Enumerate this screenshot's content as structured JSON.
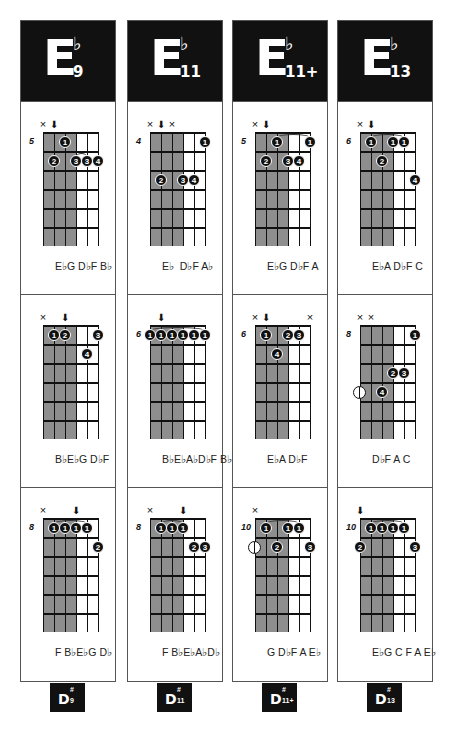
{
  "columns": [
    {
      "root": "E",
      "accidental": "♭",
      "quality": "9",
      "footer": {
        "root": "D",
        "accidental": "#",
        "quality": "9"
      },
      "x": 20,
      "diagrams": [
        {
          "start_fret": "5",
          "marks": [
            {
              "string": 0,
              "type": "x"
            },
            {
              "string": 1,
              "type": "arrow"
            }
          ],
          "dots": [
            {
              "string": 2,
              "fret": 1,
              "finger": "1"
            },
            {
              "string": 1,
              "fret": 2,
              "finger": "2"
            },
            {
              "string": 3,
              "fret": 2,
              "finger": "3"
            },
            {
              "string": 4,
              "fret": 2,
              "finger": "3"
            },
            {
              "string": 5,
              "fret": 2,
              "finger": "4"
            }
          ],
          "opens": [],
          "barres": [
            {
              "from": 3,
              "to": 4,
              "fret": 2
            }
          ],
          "notes": "E♭G D♭F B♭"
        },
        {
          "start_fret": "",
          "marks": [
            {
              "string": 0,
              "type": "x"
            },
            {
              "string": 2,
              "type": "arrow"
            }
          ],
          "dots": [
            {
              "string": 1,
              "fret": 1,
              "finger": "1"
            },
            {
              "string": 2,
              "fret": 1,
              "finger": "2"
            },
            {
              "string": 5,
              "fret": 1,
              "finger": "3"
            },
            {
              "string": 4,
              "fret": 2,
              "finger": "4"
            }
          ],
          "opens": [],
          "barres": [],
          "notes": "B♭E♭G D♭F"
        },
        {
          "start_fret": "8",
          "marks": [
            {
              "string": 0,
              "type": "x"
            },
            {
              "string": 3,
              "type": "arrow"
            }
          ],
          "dots": [
            {
              "string": 1,
              "fret": 1,
              "finger": "1"
            },
            {
              "string": 2,
              "fret": 1,
              "finger": "1"
            },
            {
              "string": 3,
              "fret": 1,
              "finger": "1"
            },
            {
              "string": 4,
              "fret": 1,
              "finger": "1"
            },
            {
              "string": 5,
              "fret": 2,
              "finger": "2"
            }
          ],
          "opens": [],
          "barres": [
            {
              "from": 1,
              "to": 4,
              "fret": 1
            }
          ],
          "notes": "F B♭E♭G D♭"
        }
      ]
    },
    {
      "root": "E",
      "accidental": "♭",
      "quality": "11",
      "footer": {
        "root": "D",
        "accidental": "#",
        "quality": "11"
      },
      "x": 127,
      "diagrams": [
        {
          "start_fret": "4",
          "marks": [
            {
              "string": 0,
              "type": "x"
            },
            {
              "string": 1,
              "type": "arrow"
            },
            {
              "string": 2,
              "type": "x"
            }
          ],
          "dots": [
            {
              "string": 5,
              "fret": 1,
              "finger": "1"
            },
            {
              "string": 1,
              "fret": 3,
              "finger": "2"
            },
            {
              "string": 3,
              "fret": 3,
              "finger": "3"
            },
            {
              "string": 4,
              "fret": 3,
              "finger": "4"
            }
          ],
          "opens": [],
          "barres": [],
          "notes": "E♭  D♭F A♭"
        },
        {
          "start_fret": "6",
          "marks": [
            {
              "string": 1,
              "type": "arrow"
            }
          ],
          "dots": [
            {
              "string": 0,
              "fret": 1,
              "finger": "1"
            },
            {
              "string": 1,
              "fret": 1,
              "finger": "1"
            },
            {
              "string": 2,
              "fret": 1,
              "finger": "1"
            },
            {
              "string": 3,
              "fret": 1,
              "finger": "1"
            },
            {
              "string": 4,
              "fret": 1,
              "finger": "1"
            },
            {
              "string": 5,
              "fret": 1,
              "finger": "1"
            }
          ],
          "opens": [],
          "barres": [
            {
              "from": 0,
              "to": 5,
              "fret": 1
            }
          ],
          "notes": "B♭E♭A♭D♭F B♭"
        },
        {
          "start_fret": "8",
          "marks": [
            {
              "string": 0,
              "type": "x"
            },
            {
              "string": 3,
              "type": "arrow"
            }
          ],
          "dots": [
            {
              "string": 1,
              "fret": 1,
              "finger": "1"
            },
            {
              "string": 2,
              "fret": 1,
              "finger": "1"
            },
            {
              "string": 3,
              "fret": 1,
              "finger": "1"
            },
            {
              "string": 4,
              "fret": 2,
              "finger": "2"
            },
            {
              "string": 5,
              "fret": 2,
              "finger": "3"
            }
          ],
          "opens": [],
          "barres": [
            {
              "from": 1,
              "to": 3,
              "fret": 1
            }
          ],
          "notes": "F B♭E♭A♭D♭"
        }
      ]
    },
    {
      "root": "E",
      "accidental": "♭",
      "quality": "11+",
      "footer": {
        "root": "D",
        "accidental": "#",
        "quality": "11+"
      },
      "x": 232,
      "diagrams": [
        {
          "start_fret": "5",
          "marks": [
            {
              "string": 0,
              "type": "x"
            },
            {
              "string": 1,
              "type": "arrow"
            }
          ],
          "dots": [
            {
              "string": 2,
              "fret": 1,
              "finger": "1"
            },
            {
              "string": 5,
              "fret": 1,
              "finger": "1"
            },
            {
              "string": 1,
              "fret": 2,
              "finger": "2"
            },
            {
              "string": 3,
              "fret": 2,
              "finger": "3"
            },
            {
              "string": 4,
              "fret": 2,
              "finger": "4"
            }
          ],
          "opens": [],
          "barres": [
            {
              "from": 2,
              "to": 5,
              "fret": 1
            }
          ],
          "notes": "E♭G D♭F A"
        },
        {
          "start_fret": "6",
          "marks": [
            {
              "string": 0,
              "type": "x"
            },
            {
              "string": 1,
              "type": "arrow"
            },
            {
              "string": 5,
              "type": "x"
            }
          ],
          "dots": [
            {
              "string": 1,
              "fret": 1,
              "finger": "1"
            },
            {
              "string": 3,
              "fret": 1,
              "finger": "2"
            },
            {
              "string": 4,
              "fret": 1,
              "finger": "3"
            },
            {
              "string": 2,
              "fret": 2,
              "finger": "4"
            }
          ],
          "opens": [],
          "barres": [],
          "notes": "E♭A D♭F"
        },
        {
          "start_fret": "10",
          "marks": [
            {
              "string": 0,
              "type": "x"
            }
          ],
          "dots": [
            {
              "string": 1,
              "fret": 1,
              "finger": "1"
            },
            {
              "string": 3,
              "fret": 1,
              "finger": "1"
            },
            {
              "string": 4,
              "fret": 1,
              "finger": "1"
            },
            {
              "string": 2,
              "fret": 2,
              "finger": "2"
            },
            {
              "string": 5,
              "fret": 2,
              "finger": "3"
            }
          ],
          "opens": [
            {
              "string": 0,
              "fret": 2
            }
          ],
          "barres": [
            {
              "from": 1,
              "to": 4,
              "fret": 1
            }
          ],
          "notes": "G D♭F A E♭"
        }
      ]
    },
    {
      "root": "E",
      "accidental": "♭",
      "quality": "13",
      "footer": {
        "root": "D",
        "accidental": "#",
        "quality": "13"
      },
      "x": 337,
      "diagrams": [
        {
          "start_fret": "6",
          "marks": [
            {
              "string": 0,
              "type": "x"
            },
            {
              "string": 1,
              "type": "arrow"
            }
          ],
          "dots": [
            {
              "string": 1,
              "fret": 1,
              "finger": "1"
            },
            {
              "string": 3,
              "fret": 1,
              "finger": "1"
            },
            {
              "string": 4,
              "fret": 1,
              "finger": "1"
            },
            {
              "string": 2,
              "fret": 2,
              "finger": "2"
            },
            {
              "string": 5,
              "fret": 3,
              "finger": "4"
            }
          ],
          "opens": [],
          "barres": [
            {
              "from": 1,
              "to": 4,
              "fret": 1
            }
          ],
          "notes": "E♭A D♭F C"
        },
        {
          "start_fret": "8",
          "marks": [
            {
              "string": 0,
              "type": "x"
            },
            {
              "string": 1,
              "type": "x"
            }
          ],
          "dots": [
            {
              "string": 5,
              "fret": 1,
              "finger": "1"
            },
            {
              "string": 3,
              "fret": 3,
              "finger": "2"
            },
            {
              "string": 4,
              "fret": 3,
              "finger": "3"
            },
            {
              "string": 2,
              "fret": 4,
              "finger": "4"
            }
          ],
          "opens": [
            {
              "string": 0,
              "fret": 4
            }
          ],
          "barres": [],
          "notes": "D♭F A C"
        },
        {
          "start_fret": "10",
          "marks": [
            {
              "string": 0,
              "type": "arrow"
            }
          ],
          "dots": [
            {
              "string": 1,
              "fret": 1,
              "finger": "1"
            },
            {
              "string": 2,
              "fret": 1,
              "finger": "1"
            },
            {
              "string": 3,
              "fret": 1,
              "finger": "1"
            },
            {
              "string": 4,
              "fret": 1,
              "finger": "1"
            },
            {
              "string": 0,
              "fret": 2,
              "finger": "2"
            },
            {
              "string": 5,
              "fret": 2,
              "finger": "3"
            }
          ],
          "opens": [],
          "barres": [
            {
              "from": 1,
              "to": 4,
              "fret": 1
            }
          ],
          "notes": "E♭G C F A E♭"
        }
      ]
    }
  ],
  "colors": {
    "header_bg": "#111111",
    "shade": "#8e8e8e",
    "line": "#111111",
    "border": "#555555"
  }
}
